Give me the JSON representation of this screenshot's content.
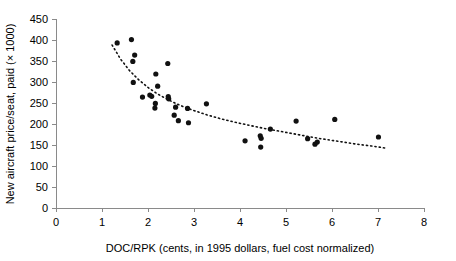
{
  "chart_data": {
    "type": "scatter",
    "title": "",
    "xlabel": "DOC/RPK (cents, in 1995 dollars, fuel cost normalized)",
    "ylabel": "New aircraft price/seat, paid (× 1000)",
    "xlim": [
      0,
      8
    ],
    "ylim": [
      0,
      450
    ],
    "xticks": [
      0,
      1,
      2,
      3,
      4,
      5,
      6,
      7,
      8
    ],
    "yticks": [
      0,
      50,
      100,
      150,
      200,
      250,
      300,
      350,
      400,
      450
    ],
    "grid": false,
    "legend": false,
    "marker": "filled-circle",
    "marker_color": "#111111",
    "series": [
      {
        "name": "New aircraft price/seat vs DOC/RPK",
        "points": [
          [
            1.33,
            393
          ],
          [
            1.64,
            401
          ],
          [
            1.67,
            349
          ],
          [
            1.71,
            364
          ],
          [
            1.68,
            299
          ],
          [
            1.88,
            264
          ],
          [
            2.04,
            269
          ],
          [
            2.08,
            266
          ],
          [
            2.17,
            319
          ],
          [
            2.16,
            249
          ],
          [
            2.15,
            238
          ],
          [
            2.21,
            290
          ],
          [
            2.43,
            344
          ],
          [
            2.44,
            265
          ],
          [
            2.45,
            260
          ],
          [
            2.57,
            221
          ],
          [
            2.6,
            240
          ],
          [
            2.66,
            208
          ],
          [
            2.86,
            237
          ],
          [
            2.88,
            203
          ],
          [
            3.27,
            248
          ],
          [
            4.11,
            160
          ],
          [
            4.44,
            172
          ],
          [
            4.46,
            166
          ],
          [
            4.45,
            145
          ],
          [
            4.66,
            188
          ],
          [
            5.22,
            207
          ],
          [
            5.47,
            165
          ],
          [
            5.63,
            152
          ],
          [
            5.68,
            157
          ],
          [
            6.06,
            211
          ],
          [
            7.01,
            169
          ]
        ]
      }
    ],
    "trendline": {
      "name": "power-fit-trend",
      "style": "dotted",
      "points": [
        [
          1.22,
          388
        ],
        [
          1.4,
          355
        ],
        [
          1.6,
          327
        ],
        [
          1.8,
          305
        ],
        [
          2.0,
          287
        ],
        [
          2.2,
          272
        ],
        [
          2.4,
          260
        ],
        [
          2.6,
          249
        ],
        [
          2.8,
          240
        ],
        [
          3.0,
          232
        ],
        [
          3.3,
          221
        ],
        [
          3.6,
          212
        ],
        [
          3.9,
          204
        ],
        [
          4.2,
          197
        ],
        [
          4.5,
          190
        ],
        [
          4.8,
          184
        ],
        [
          5.1,
          178
        ],
        [
          5.4,
          172
        ],
        [
          5.7,
          166
        ],
        [
          6.0,
          161
        ],
        [
          6.3,
          156
        ],
        [
          6.6,
          151
        ],
        [
          6.9,
          147
        ],
        [
          7.2,
          142
        ]
      ]
    }
  },
  "axes": {
    "x_tick_labels": [
      "0",
      "1",
      "2",
      "3",
      "4",
      "5",
      "6",
      "7",
      "8"
    ],
    "y_tick_labels": [
      "0",
      "50",
      "100",
      "150",
      "200",
      "250",
      "300",
      "350",
      "400",
      "450"
    ],
    "x_axis_title": "DOC/RPK (cents, in 1995 dollars, fuel cost normalized)",
    "y_axis_title": "New aircraft price/seat, paid (× 1000)"
  },
  "colors": {
    "background": "#ffffff",
    "axis": "#8a8a8a",
    "marker": "#111111",
    "text": "#000000"
  }
}
